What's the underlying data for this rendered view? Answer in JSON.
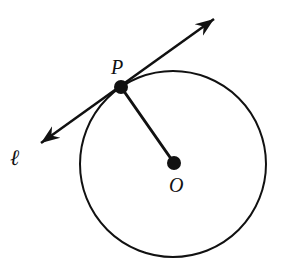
{
  "figure": {
    "background_color": "#ffffff",
    "stroke_color": "#111111",
    "width": 281,
    "height": 275
  },
  "circle": {
    "label": "circle-O",
    "center_x": 173,
    "center_y": 164,
    "radius": 93,
    "stroke_color": "#111111",
    "stroke_width": 2,
    "fill": "none"
  },
  "points": [
    {
      "name": "P",
      "label": "P",
      "x": 121,
      "y": 87,
      "dot_radius": 7,
      "label_x": 111,
      "label_y": 74,
      "color": "#111111"
    },
    {
      "name": "O",
      "label": "O",
      "x": 174,
      "y": 163,
      "dot_radius": 7,
      "label_x": 169,
      "label_y": 192,
      "color": "#111111"
    }
  ],
  "segments": [
    {
      "name": "radius-OP",
      "from_x": 121,
      "from_y": 87,
      "to_x": 174,
      "to_y": 163,
      "stroke_width": 3
    }
  ],
  "tangent_line": {
    "name": "tangent-line-l",
    "label": "ℓ",
    "label_x": 10,
    "label_y": 165,
    "start_x": 41,
    "start_y": 143,
    "end_x": 214,
    "end_y": 19,
    "stroke_width": 2.5,
    "arrowheads": "both",
    "touches_point": "P"
  }
}
